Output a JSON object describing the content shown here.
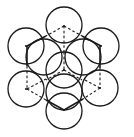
{
  "diagram": {
    "title": "",
    "stroke_color": "#1a1a1a",
    "background": "#ffffff",
    "sphere_radius": 18,
    "vertices": {
      "top": [
        64,
        26
      ],
      "top_left": [
        26,
        46
      ],
      "top_right": [
        101,
        46
      ],
      "bottom_left": [
        26,
        89
      ],
      "bottom_right": [
        100,
        88
      ],
      "bottom": [
        64,
        110
      ],
      "center": [
        64,
        70
      ]
    },
    "spheres_back": [
      {
        "name": "inner-upper-left",
        "cx": 44,
        "cy": 57
      },
      {
        "name": "inner-upper-right",
        "cx": 83,
        "cy": 57
      },
      {
        "name": "inner-lower",
        "cx": 64,
        "cy": 92
      }
    ],
    "spheres_front": [
      {
        "name": "top",
        "cx": 64,
        "cy": 25
      },
      {
        "name": "top-left",
        "cx": 26,
        "cy": 46
      },
      {
        "name": "top-right",
        "cx": 101,
        "cy": 46
      },
      {
        "name": "bottom-left",
        "cx": 26,
        "cy": 89
      },
      {
        "name": "bottom-right",
        "cx": 100,
        "cy": 88
      },
      {
        "name": "bottom",
        "cx": 64,
        "cy": 111
      },
      {
        "name": "center",
        "cx": 64,
        "cy": 70
      }
    ],
    "edges_solid": [
      [
        [
          46,
          36
        ],
        [
          27,
          46
        ]
      ],
      [
        [
          82,
          36
        ],
        [
          101,
          46
        ]
      ],
      [
        [
          27,
          46
        ],
        [
          27,
          66
        ]
      ],
      [
        [
          100,
          46
        ],
        [
          100,
          68
        ]
      ],
      [
        [
          46,
          100
        ],
        [
          64,
          110
        ]
      ],
      [
        [
          83,
          99
        ],
        [
          64,
          110
        ]
      ]
    ],
    "edges_dashed": [
      [
        [
          64,
          26
        ],
        [
          46,
          36
        ]
      ],
      [
        [
          64,
          26
        ],
        [
          82,
          36
        ]
      ],
      [
        [
          64,
          26
        ],
        [
          64,
          52
        ]
      ],
      [
        [
          27,
          66
        ],
        [
          27,
          89
        ]
      ],
      [
        [
          100,
          68
        ],
        [
          100,
          88
        ]
      ],
      [
        [
          27,
          89
        ],
        [
          46,
          79
        ]
      ],
      [
        [
          27,
          89
        ],
        [
          46,
          100
        ]
      ],
      [
        [
          100,
          88
        ],
        [
          83,
          79
        ]
      ],
      [
        [
          100,
          88
        ],
        [
          83,
          99
        ]
      ],
      [
        [
          64,
          52
        ],
        [
          64,
          70
        ]
      ],
      [
        [
          64,
          70
        ],
        [
          46,
          80
        ]
      ],
      [
        [
          64,
          70
        ],
        [
          82,
          80
        ]
      ]
    ]
  }
}
